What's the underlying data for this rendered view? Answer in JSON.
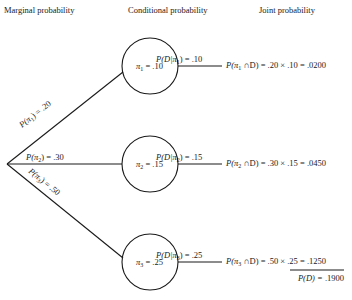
{
  "headers": {
    "marginal": "Marginal probability",
    "conditional": "Conditional probability",
    "joint": "Joint probability"
  },
  "branches": [
    {
      "marginal_label": "P(π1) = .20",
      "node_label": "π1 = .10",
      "conditional_label": "P(D|π1) = .10",
      "joint_label": "P(π1 ∩D) = .20 × .10 = .0200"
    },
    {
      "marginal_label": "P(π2) = .30",
      "node_label": "π2 = .15",
      "conditional_label": "P(D|π2) = .15",
      "joint_label": "P(π2 ∩D) = .30 × .15 = .0450"
    },
    {
      "marginal_label": "P(π3) = .50",
      "node_label": "π3 = .25",
      "conditional_label": "P(D|π3) = .25",
      "joint_label": "P(π3 ∩D) = .50 × .25 = .1250"
    }
  ],
  "total": {
    "label": "P(D) = .1900"
  },
  "parts": {
    "m1_pre": "P(π",
    "m1_sub": "1",
    "m1_post": ") = .20",
    "m2_pre": "P(π",
    "m2_sub": "2",
    "m2_post": ") = .30",
    "m3_pre": "P(π",
    "m3_sub": "3",
    "m3_post": ") = .50",
    "n1_pre": "π",
    "n1_sub": "1",
    "n1_post": " = .10",
    "n2_pre": "π",
    "n2_sub": "2",
    "n2_post": " = .15",
    "n3_pre": "π",
    "n3_sub": "3",
    "n3_post": " = .25",
    "c1_pre": "P(D|π",
    "c1_sub": "1",
    "c1_post": ") = .10",
    "c2_pre": "P(D|π",
    "c2_sub": "2",
    "c2_post": ") = .15",
    "c3_pre": "P(D|π",
    "c3_sub": "3",
    "c3_post": ") = .25",
    "j1_pre": "P(π",
    "j1_sub": "1",
    "j1_post": " ∩D) = .20 × .10 = .0200",
    "j2_pre": "P(π",
    "j2_sub": "2",
    "j2_post": " ∩D) = .30 × .15 = .0450",
    "j3_pre": "P(π",
    "j3_sub": "3",
    "j3_post": " ∩D) = .50 × .25 = ",
    "j3_val": ".1250",
    "total_pre": "P(D) = ",
    "total_val": ".1900"
  }
}
